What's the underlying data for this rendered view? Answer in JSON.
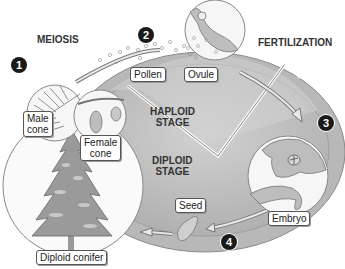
{
  "diagram": {
    "title_labels": {
      "meiosis": "MEIOSIS",
      "fertilization": "FERTILIZATION",
      "haploid_stage_line1": "HAPLOID",
      "haploid_stage_line2": "STAGE",
      "diploid_stage_line1": "DIPLOID",
      "diploid_stage_line2": "STAGE"
    },
    "step_numbers": [
      "1",
      "2",
      "3",
      "4"
    ],
    "callouts": {
      "male_cone_line1": "Male",
      "male_cone_line2": "cone",
      "female_cone_line1": "Female",
      "female_cone_line2": "cone",
      "pollen": "Pollen",
      "ovule": "Ovule",
      "embryo": "Embryo",
      "seed": "Seed",
      "diploid_conifer": "Diploid conifer"
    },
    "colors": {
      "ring": "#b8b8b8",
      "ring_edge": "#8a8a8a",
      "diploid_fill": "#c4c4c4",
      "haploid_fill": "#d6d6d6",
      "step_badge": "#1a1a1a"
    }
  }
}
